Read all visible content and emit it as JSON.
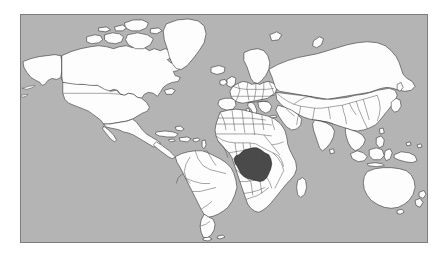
{
  "page": {
    "background_color": "#ffffff",
    "width": 448,
    "height": 255
  },
  "map": {
    "title": "World locator map",
    "projection": "Mercator",
    "frame": {
      "x": 20,
      "y": 14,
      "width": 408,
      "height": 229,
      "border_color": "#7d7d7d",
      "border_width": 1
    },
    "ocean_color": "#b4b4b4",
    "land_color": "#fdfdfd",
    "border_color": "#2b2b2b",
    "highlight_color": "#4a4a4a",
    "highlighted_country": {
      "name": "Democratic Republic of the Congo",
      "continent": "Africa",
      "color": "#4a4a4a"
    },
    "continents": [
      "North America",
      "South America",
      "Europe",
      "Africa",
      "Asia",
      "Oceania"
    ]
  }
}
